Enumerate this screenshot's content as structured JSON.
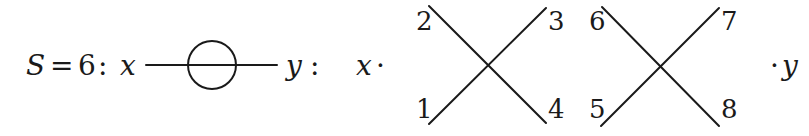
{
  "equation": {
    "lhs_symbol": "S",
    "equals": "=",
    "value": "6",
    "colon1": ":",
    "left_var": "x",
    "right_var": "y",
    "colon2": ":",
    "factor_left": "x",
    "dot_left": "·",
    "dot_right": "·",
    "factor_right": "y"
  },
  "diagram": {
    "propagator": {
      "type": "line-with-loop",
      "description": "horizontal line through a circle"
    },
    "vertex_a": {
      "labels": {
        "top_left": "2",
        "top_right": "3",
        "bottom_left": "1",
        "bottom_right": "4"
      }
    },
    "vertex_b": {
      "labels": {
        "top_left": "6",
        "top_right": "7",
        "bottom_left": "5",
        "bottom_right": "8"
      }
    }
  },
  "colors": {
    "ink": "#1a1a1a",
    "background": "#ffffff"
  }
}
